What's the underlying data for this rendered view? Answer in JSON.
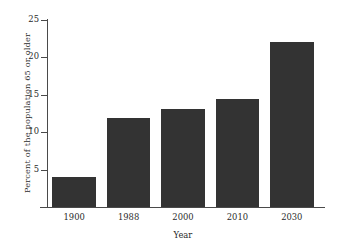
{
  "chart_data": {
    "type": "bar",
    "title": "",
    "categories": [
      "1900",
      "1988",
      "2000",
      "2010",
      "2030"
    ],
    "values": [
      4.0,
      11.9,
      13.1,
      14.4,
      22.1
    ],
    "xlabel": "Year",
    "ylabel": "Percent of the population 65 or older",
    "ylim": [
      0,
      25
    ],
    "yticks": [
      5,
      10,
      15,
      20,
      25
    ],
    "ytick_labels": [
      "5",
      "10",
      "15",
      "20",
      "25"
    ],
    "grid": false,
    "legend": null,
    "bar_color": "#333333",
    "axis_color": "#4a4a4a",
    "background": "#ffffff"
  }
}
